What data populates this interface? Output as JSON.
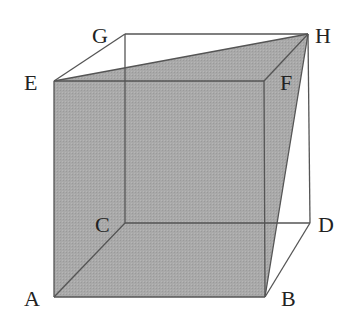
{
  "diagram": {
    "type": "cube-with-section",
    "vertices": {
      "A": [
        54,
        297
      ],
      "B": [
        265,
        297
      ],
      "C": [
        125,
        223
      ],
      "D": [
        310,
        223
      ],
      "E": [
        54,
        81
      ],
      "F": [
        264,
        81
      ],
      "G": [
        125,
        34
      ],
      "H": [
        308,
        34
      ]
    },
    "labels": {
      "A": "A",
      "B": "B",
      "C": "C",
      "D": "D",
      "E": "E",
      "F": "F",
      "G": "G",
      "H": "H"
    },
    "shaded_section": [
      "A",
      "B",
      "H",
      "E"
    ],
    "colors": {
      "shade": "#a8a8a8",
      "edge": "#555555",
      "background": "#ffffff"
    }
  }
}
